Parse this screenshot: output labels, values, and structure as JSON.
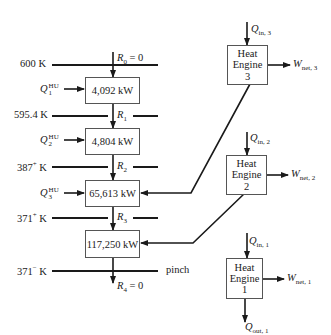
{
  "temperatures": [
    {
      "label": "600 K"
    },
    {
      "label": "595.4 K"
    },
    {
      "label": "387",
      "sup": "+",
      "unit": " K"
    },
    {
      "label": "371",
      "sup": "+",
      "unit": " K"
    },
    {
      "label": "371",
      "sup": "−",
      "unit": " K"
    }
  ],
  "residuals": [
    {
      "sym": "R",
      "sub": "0",
      "suffix": " = 0"
    },
    {
      "sym": "R",
      "sub": "1",
      "suffix": ""
    },
    {
      "sym": "R",
      "sub": "2",
      "suffix": ""
    },
    {
      "sym": "R",
      "sub": "3",
      "suffix": ""
    },
    {
      "sym": "R",
      "sub": "4",
      "suffix": " = 0"
    }
  ],
  "hot_utilities": [
    {
      "sym": "Q",
      "sup": "HU",
      "sub": "1"
    },
    {
      "sym": "Q",
      "sup": "HU",
      "sub": "2"
    },
    {
      "sym": "Q",
      "sup": "HU",
      "sub": "3"
    }
  ],
  "intervals": [
    {
      "value": "4,092 kW"
    },
    {
      "value": "4,804 kW"
    },
    {
      "value": "65,613 kW"
    },
    {
      "value": "117,250 kW"
    }
  ],
  "pinch_label": "pinch",
  "heat_engines": [
    {
      "line1": "Heat",
      "line2": "Engine",
      "num": "3",
      "q_in": "in, 3",
      "w_net": "net, 3"
    },
    {
      "line1": "Heat",
      "line2": "Engine",
      "num": "2",
      "q_in": "in, 2",
      "w_net": "net, 2"
    },
    {
      "line1": "Heat",
      "line2": "Engine",
      "num": "1",
      "q_in": "in, 1",
      "w_net": "net, 1",
      "q_out": "out, 1"
    }
  ],
  "symbols": {
    "Q": "Q",
    "W": "W"
  }
}
